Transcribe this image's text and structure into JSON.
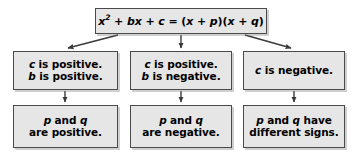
{
  "diagram": {
    "colors": {
      "box_fill": "#e6e6e6",
      "box_border": "#4a4a4a",
      "text": "#000000",
      "arrow": "#3a3a3a",
      "background": "#ffffff"
    },
    "equation": {
      "lhs_x": "x",
      "lhs_exponent": "2",
      "lhs_rest": " + ",
      "lhs_b": "b",
      "lhs_bx": "x",
      "plus": " + ",
      "lhs_c": "c",
      "equals": " = (",
      "rhs_x1": "x",
      "rhs_plus1": " + ",
      "rhs_p": "p",
      "rhs_close1": ")(",
      "rhs_x2": "x",
      "rhs_plus2": " + ",
      "rhs_q": "q",
      "rhs_close2": ")",
      "full_text": "x² + bx + c = (x + p)(x + q)"
    },
    "branches": [
      {
        "id": "left",
        "condition": {
          "line1_var": "c",
          "line1_text": " is positive.",
          "line2_var": "b",
          "line2_text": " is positive.",
          "full_text": "c is positive. b is positive."
        },
        "result": {
          "line1_var1": "p",
          "line1_mid": " and ",
          "line1_var2": "q",
          "line2_text": "are positive.",
          "full_text": "p and q are positive."
        }
      },
      {
        "id": "middle",
        "condition": {
          "line1_var": "c",
          "line1_text": " is positive.",
          "line2_var": "b",
          "line2_text": " is negative.",
          "full_text": "c is positive. b is negative."
        },
        "result": {
          "line1_var1": "p",
          "line1_mid": " and ",
          "line1_var2": "q",
          "line2_text": "are negative.",
          "full_text": "p and q are negative."
        }
      },
      {
        "id": "right",
        "condition": {
          "line1_var": "c",
          "line1_text": " is negative.",
          "line2_var": "",
          "line2_text": "",
          "full_text": "c is negative."
        },
        "result": {
          "line1_var1": "p",
          "line1_mid": " and ",
          "line1_var2": "q",
          "line1_tail": " have",
          "line2_text": "different signs.",
          "full_text": "p and q have different signs."
        }
      }
    ],
    "arrows": [
      {
        "name": "equation-to-left-condition",
        "from": "equation-box",
        "to": "cond-left",
        "direction": "diagonal-left"
      },
      {
        "name": "equation-to-middle-condition",
        "from": "equation-box",
        "to": "cond-middle",
        "direction": "vertical"
      },
      {
        "name": "equation-to-right-condition",
        "from": "equation-box",
        "to": "cond-right",
        "direction": "diagonal-right"
      },
      {
        "name": "left-condition-to-result",
        "from": "cond-left",
        "to": "result-left",
        "direction": "vertical"
      },
      {
        "name": "middle-condition-to-result",
        "from": "cond-middle",
        "to": "result-middle",
        "direction": "vertical"
      },
      {
        "name": "right-condition-to-result",
        "from": "cond-right",
        "to": "result-right",
        "direction": "vertical"
      }
    ]
  }
}
